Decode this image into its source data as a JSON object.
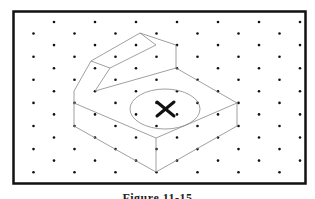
{
  "figure": {
    "caption": "Figure 11-15",
    "colors": {
      "frame": "#111111",
      "dot": "#111111",
      "line": "#777777",
      "mark": "#111111"
    }
  }
}
